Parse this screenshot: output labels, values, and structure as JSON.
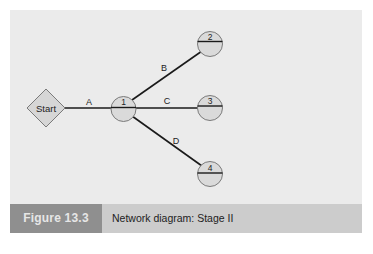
{
  "figure": {
    "number_label": "Figure 13.3",
    "caption": "Network diagram: Stage II"
  },
  "colors": {
    "panel_background": "#ebebeb",
    "caption_bar": "#cccccc",
    "caption_label_box": "#8f8f8f",
    "caption_label_text": "#e6e6e6",
    "node_fill": "#d9d9d9",
    "node_stroke": "#7a7a7a",
    "edge_stroke": "#1a1a1a"
  },
  "diagram": {
    "start_node": {
      "label": "Start",
      "shape": "diamond"
    },
    "nodes": [
      {
        "id": "1",
        "label": "1"
      },
      {
        "id": "2",
        "label": "2"
      },
      {
        "id": "3",
        "label": "3"
      },
      {
        "id": "4",
        "label": "4"
      }
    ],
    "edges": [
      {
        "label": "A",
        "from": "Start",
        "to": "1"
      },
      {
        "label": "B",
        "from": "1",
        "to": "2"
      },
      {
        "label": "C",
        "from": "1",
        "to": "3"
      },
      {
        "label": "D",
        "from": "1",
        "to": "4"
      }
    ]
  }
}
